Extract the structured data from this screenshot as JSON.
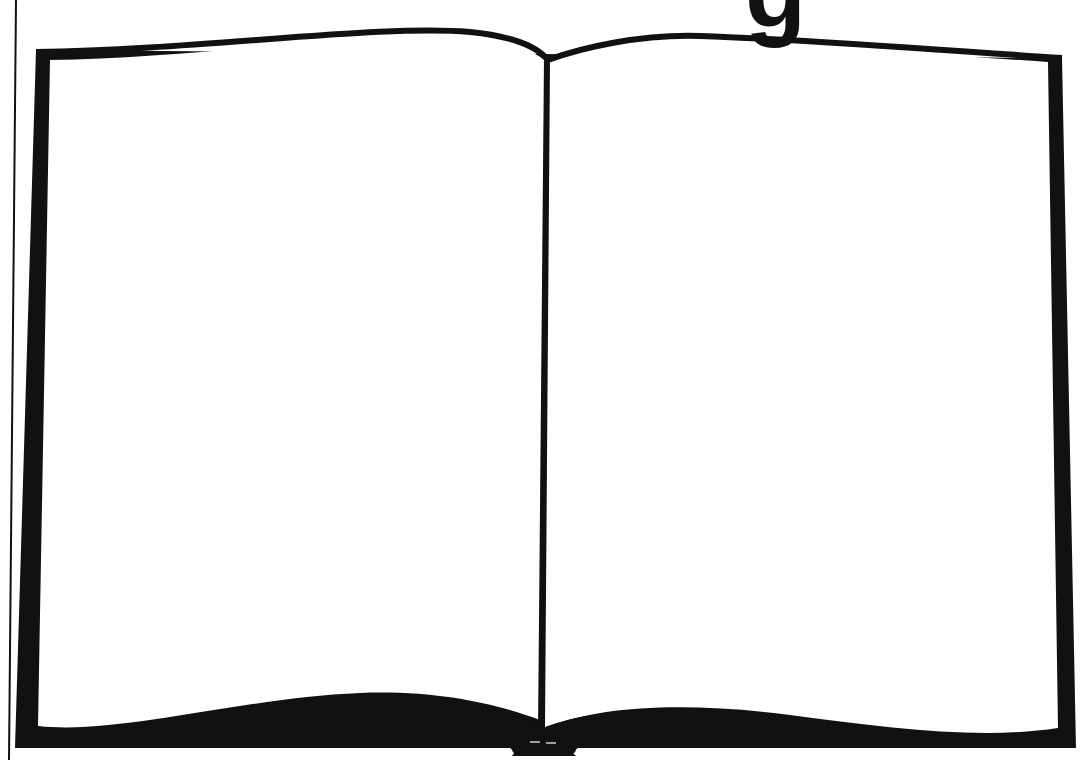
{
  "illustration": {
    "subject": "open blank book",
    "title_fragment": "g",
    "colors": {
      "ink": "#111111",
      "page": "#ffffff",
      "background": "#ffffff"
    }
  }
}
